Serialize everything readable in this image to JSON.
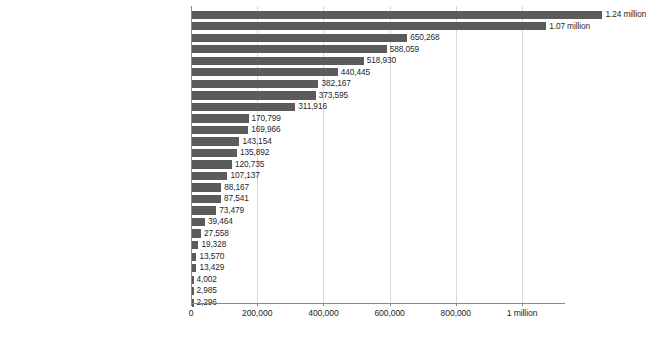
{
  "chart_data": {
    "type": "bar",
    "orientation": "horizontal",
    "title": "",
    "subtitle": "",
    "xlabel": "",
    "ylabel": "",
    "grid": true,
    "legend": null,
    "xlim": [
      0,
      1240000
    ],
    "axis": {
      "tick_values": [
        0,
        200000,
        400000,
        600000,
        800000,
        1000000
      ],
      "tick_labels": [
        "0",
        "200,000",
        "400,000",
        "600,000",
        "800,000",
        "1 million"
      ]
    },
    "categories": [
      "Cardiovascular disease",
      "Cancers",
      "Road accidents",
      "HIV/AIDS",
      "Digestive diseases",
      "Suicide",
      "Tuberculosis",
      "Liver disease",
      "Homicide",
      "Kidney disease",
      "Lower respiratory infections",
      "Respiratory disease",
      "Diarrheal diseases",
      "Diabetes mellitus",
      "Malaria",
      "Drug overdose",
      "Drowning",
      "Alcohol disorder",
      "Fire",
      "Hepatitis",
      "Nutritional deficiencies",
      "Heat-related deaths (hot or cold exposure)",
      "Protein-energy malnutrition",
      "Dementia",
      "Natural disasters",
      "Parkinson's disease"
    ],
    "values": [
      1240000,
      1070000,
      650268,
      588059,
      518930,
      440445,
      382167,
      373595,
      311916,
      170799,
      169966,
      143154,
      135892,
      120735,
      107137,
      88167,
      87541,
      73479,
      39464,
      27558,
      19328,
      13570,
      13429,
      4002,
      2985,
      2296
    ],
    "value_labels": [
      "1.24 million",
      "1.07 million",
      "650,268",
      "588,059",
      "518,930",
      "440,445",
      "382,167",
      "373,595",
      "311,916",
      "170,799",
      "169,966",
      "143,154",
      "135,892",
      "120,735",
      "107,137",
      "88,167",
      "87,541",
      "73,479",
      "39,464",
      "27,558",
      "19,328",
      "13,570",
      "13,429",
      "4,002",
      "2,985",
      "2,296"
    ],
    "colors": {
      "bar": "#5b5b5b",
      "grid": "#d8d8d8",
      "axis": "#8a8a8a",
      "text": "#1f1f1f",
      "background": "#ffffff"
    }
  }
}
